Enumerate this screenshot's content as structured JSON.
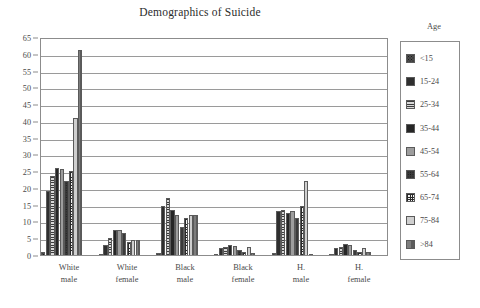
{
  "chart_data": {
    "type": "bar",
    "title": "Demographics of Suicide",
    "xlabel": "",
    "ylabel": "",
    "ylim": [
      0,
      65
    ],
    "yticks": [
      0,
      5,
      10,
      15,
      20,
      25,
      30,
      35,
      40,
      45,
      50,
      55,
      60,
      65
    ],
    "grid": true,
    "legend_position": "right-outside",
    "legend_title": "Age",
    "categories": [
      "White male",
      "White female",
      "Black male",
      "Black female",
      "H. male",
      "H. female"
    ],
    "category_lines": [
      [
        "White",
        "male"
      ],
      [
        "White",
        "female"
      ],
      [
        "Black",
        "male"
      ],
      [
        "Black",
        "female"
      ],
      [
        "H.",
        "male"
      ],
      [
        "H.",
        "female"
      ]
    ],
    "series": [
      {
        "name": "<15",
        "pattern": "dark-speckled",
        "color": "#4d4d4d",
        "values": [
          1.0,
          0.3,
          0.5,
          0.2,
          0.5,
          0.2
        ]
      },
      {
        "name": "15-24",
        "pattern": "solid-very-dark",
        "color": "#2f2f2f",
        "values": [
          19.0,
          3.0,
          14.5,
          2.0,
          13.0,
          2.0
        ]
      },
      {
        "name": "25-34",
        "pattern": "horizontal-lines",
        "color": "#b4b4b4",
        "values": [
          23.5,
          5.0,
          17.0,
          2.5,
          13.5,
          2.5
        ]
      },
      {
        "name": "35-44",
        "pattern": "solid-near-black",
        "color": "#262626",
        "values": [
          26.0,
          7.5,
          13.5,
          3.0,
          12.5,
          3.2
        ]
      },
      {
        "name": "45-54",
        "pattern": "solid-mid-gray",
        "color": "#9d9d9d",
        "values": [
          25.5,
          7.5,
          12.0,
          2.8,
          13.0,
          3.0
        ]
      },
      {
        "name": "55-64",
        "pattern": "dark-speckled",
        "color": "#3a3a3a",
        "values": [
          22.0,
          6.5,
          8.5,
          1.5,
          11.0,
          1.5
        ]
      },
      {
        "name": "65-74",
        "pattern": "checker-grid",
        "color": "#f2f2f2",
        "values": [
          25.0,
          4.0,
          11.0,
          0.8,
          14.5,
          1.0
        ]
      },
      {
        "name": "75-84",
        "pattern": "solid-light-gray",
        "color": "#cfcfcf",
        "values": [
          41.0,
          4.5,
          12.0,
          2.5,
          22.0,
          2.0
        ]
      },
      {
        "name": ">84",
        "pattern": "gradient-gray",
        "color": "#6e6e6e",
        "values": [
          61.0,
          4.5,
          12.0,
          0.5,
          0.3,
          0.8
        ]
      }
    ]
  },
  "legend": {
    "title": "Age",
    "items": [
      {
        "label": "<15"
      },
      {
        "label": "15-24"
      },
      {
        "label": "25-34"
      },
      {
        "label": "35-44"
      },
      {
        "label": "45-54"
      },
      {
        "label": "55-64"
      },
      {
        "label": "65-74"
      },
      {
        "label": "75-84"
      },
      {
        "label": ">84"
      }
    ]
  }
}
